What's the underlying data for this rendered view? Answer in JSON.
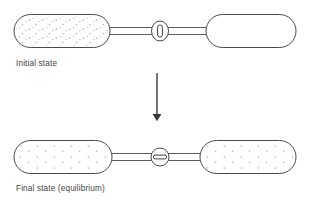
{
  "figure": {
    "type": "schematic-diagram",
    "background_color": "#ffffff",
    "line_color": "#4a4a4a",
    "particle_color": "#b9b4c4",
    "arrow_color": "#3a3a3a"
  },
  "panels": [
    {
      "id": "initial",
      "caption": "Initial state",
      "left_vessel": {
        "name": "gas-filled-vessel",
        "content": "gas",
        "particle_count": 46
      },
      "right_vessel": {
        "name": "empty-vessel",
        "content": "vacuum",
        "particle_count": 0
      },
      "valve": {
        "name": "valve-closed",
        "state": "closed",
        "glyph": "vertical-bar"
      }
    },
    {
      "id": "final",
      "caption": "Final state (equilibrium)",
      "left_vessel": {
        "name": "gas-filled-vessel",
        "content": "gas",
        "particle_count": 21
      },
      "right_vessel": {
        "name": "gas-filled-vessel",
        "content": "gas",
        "particle_count": 21
      },
      "valve": {
        "name": "valve-open",
        "state": "open",
        "glyph": "horizontal-bar"
      }
    }
  ],
  "transition": {
    "name": "downward-arrow",
    "direction": "down",
    "label": ""
  },
  "captions": {
    "initial": "Initial state",
    "final": "Final state (equilibrium)"
  }
}
